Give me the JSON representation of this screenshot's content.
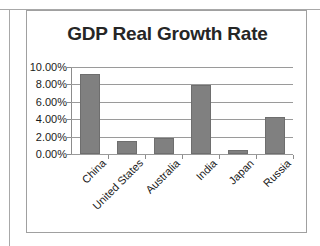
{
  "chart_data": {
    "type": "bar",
    "title": "GDP Real Growth Rate",
    "xlabel": "",
    "ylabel": "",
    "categories": [
      "China",
      "United States",
      "Australia",
      "India",
      "Japan",
      "Russia"
    ],
    "values": [
      9.2,
      1.5,
      1.8,
      7.9,
      0.5,
      4.3
    ],
    "value_labels": [
      "9.20%",
      "1.50%",
      "1.80%",
      "7.90%",
      "0.50%",
      "4.30%"
    ],
    "ylim": [
      0,
      10
    ],
    "ytick_values": [
      0,
      2,
      4,
      6,
      8,
      10
    ],
    "ytick_labels": [
      "0.00%",
      "2.00%",
      "4.00%",
      "6.00%",
      "8.00%",
      "10.00%"
    ],
    "grid": true,
    "legend": false,
    "legend_position": "none",
    "series": [
      {
        "name": "GDP Real Growth Rate",
        "values": [
          9.2,
          1.5,
          1.8,
          7.9,
          0.5,
          4.3
        ]
      }
    ],
    "colors": {
      "bar_fill": "#808080",
      "bar_stroke": "#6e6e6e",
      "gridline": "#9a9a9a",
      "axis": "#8c8c8c",
      "title_text": "#262626",
      "tick_text": "#1a1a1a",
      "plot_background": "#ffffff",
      "frame_border": "#a0a0a0"
    }
  }
}
